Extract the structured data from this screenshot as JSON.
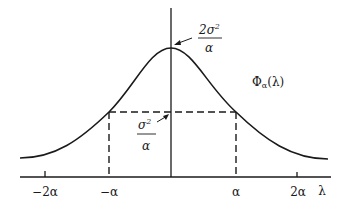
{
  "diagram": {
    "type": "function-plot",
    "function_label": "Φα(λ)",
    "function_label_main": "Φ",
    "function_label_sub": "α",
    "function_label_arg": "(λ)",
    "x_axis_label": "λ",
    "x_ticks": [
      {
        "label": "−2α",
        "value": -2
      },
      {
        "label": "−α",
        "value": -1
      },
      {
        "label": "α",
        "value": 1
      },
      {
        "label": "2α",
        "value": 2
      }
    ],
    "peak_annotation": {
      "numerator": "2σ",
      "exponent": "2",
      "denominator": "α",
      "text": "2σ²/α"
    },
    "half_annotation": {
      "numerator": "σ",
      "exponent": "2",
      "denominator": "α",
      "text": "σ²/α"
    },
    "colors": {
      "stroke": "#1a1a1a",
      "background": "#ffffff"
    }
  }
}
